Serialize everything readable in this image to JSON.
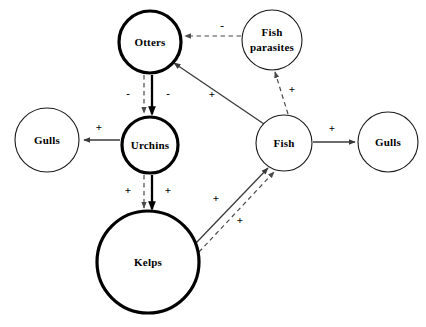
{
  "diagram": {
    "background_color": "#ffffff",
    "width": 426,
    "height": 327,
    "nodes": [
      {
        "id": "otters",
        "label": "Otters",
        "cx": 150,
        "cy": 42,
        "r": 31,
        "border": "thick",
        "color": "#000000"
      },
      {
        "id": "fish-parasites",
        "label_line1": "Fish",
        "label_line2": "parasites",
        "cx": 272,
        "cy": 40,
        "r": 30,
        "border": "thin",
        "color": "#1a1a1a"
      },
      {
        "id": "gulls-left",
        "label": "Gulls",
        "cx": 47,
        "cy": 140,
        "r": 32,
        "border": "thin",
        "color": "#1a1a1a"
      },
      {
        "id": "urchins",
        "label": "Urchins",
        "cx": 150,
        "cy": 145,
        "r": 28,
        "border": "thick",
        "color": "#000000"
      },
      {
        "id": "fish",
        "label": "Fish",
        "cx": 284,
        "cy": 143,
        "r": 28,
        "border": "thin",
        "color": "#1a1a1a"
      },
      {
        "id": "gulls-right",
        "label": "Gulls",
        "cx": 388,
        "cy": 142,
        "r": 30,
        "border": "thin",
        "color": "#1a1a1a"
      },
      {
        "id": "kelps",
        "label": "Kelps",
        "cx": 148,
        "cy": 262,
        "r": 51,
        "border": "thick",
        "color": "#000000"
      }
    ],
    "edges": [
      {
        "id": "parasites-to-otters",
        "from": "fish-parasites",
        "to": "otters",
        "style": "dashed",
        "sign": "-",
        "sign_x": 222,
        "sign_y": 26
      },
      {
        "id": "fish-to-parasites",
        "from": "fish",
        "to": "fish-parasites",
        "style": "dashed",
        "sign": "+",
        "sign_x": 285,
        "sign_y": 90
      },
      {
        "id": "fish-to-otters",
        "from": "fish",
        "to": "otters",
        "style": "solid",
        "sign": "+",
        "sign_x": 212,
        "sign_y": 95
      },
      {
        "id": "otters-to-urchins-dashed",
        "from": "otters",
        "to": "urchins",
        "style": "dashed",
        "sign": "-",
        "sign_x": 131,
        "sign_y": 94
      },
      {
        "id": "otters-to-urchins-solid",
        "from": "otters",
        "to": "urchins",
        "style": "solid-heavy",
        "sign": "-",
        "sign_x": 166,
        "sign_y": 94
      },
      {
        "id": "urchins-to-gulls-left",
        "from": "urchins",
        "to": "gulls-left",
        "style": "solid",
        "sign": "+",
        "sign_x": 96,
        "sign_y": 129
      },
      {
        "id": "urchins-to-kelps-dashed",
        "from": "urchins",
        "to": "kelps",
        "style": "dashed",
        "sign": "+",
        "sign_x": 131,
        "sign_y": 190
      },
      {
        "id": "urchins-to-kelps-solid",
        "from": "urchins",
        "to": "kelps",
        "style": "solid-heavy",
        "sign": "+",
        "sign_x": 166,
        "sign_y": 190
      },
      {
        "id": "kelps-to-fish-solid",
        "from": "kelps",
        "to": "fish",
        "style": "solid",
        "sign": "+",
        "sign_x": 219,
        "sign_y": 200
      },
      {
        "id": "kelps-to-fish-dashed",
        "from": "kelps",
        "to": "fish",
        "style": "dashed",
        "sign": "+",
        "sign_x": 243,
        "sign_y": 221
      },
      {
        "id": "fish-to-gulls-right",
        "from": "fish",
        "to": "gulls-right",
        "style": "solid",
        "sign": "+",
        "sign_x": 331,
        "sign_y": 129
      }
    ]
  }
}
